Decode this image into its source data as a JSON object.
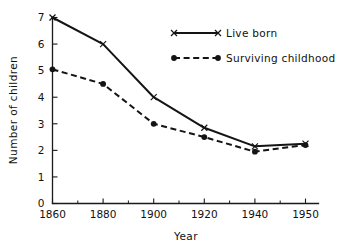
{
  "chart_data": {
    "type": "line",
    "title": "",
    "xlabel": "Year",
    "ylabel": "Number of children",
    "categories": [
      "1860",
      "1880",
      "1900",
      "1920",
      "1940",
      "1950"
    ],
    "x_tick_labels": [
      "1860",
      "1880",
      "1900",
      "1920",
      "1940",
      "1950"
    ],
    "y_tick_labels": [
      "0",
      "1",
      "2",
      "3",
      "4",
      "5",
      "6",
      "7"
    ],
    "ylim": [
      0,
      7
    ],
    "xlim_note": "categorical even spacing; 1940 to 1950 spaced same as 20-year intervals",
    "grid": false,
    "legend_position": "upper right",
    "minor_ticks_x": true,
    "minor_ticks_y": false,
    "axis_style": "left and bottom spines only, ticks pointing inward",
    "series": [
      {
        "name": "Live born",
        "marker": "x",
        "linestyle": "solid",
        "color": "#141414",
        "values": [
          7.0,
          6.0,
          4.0,
          2.85,
          2.15,
          2.25
        ]
      },
      {
        "name": "Surviving childhood",
        "marker": "filled-circle",
        "linestyle": "dashed",
        "color": "#141414",
        "values": [
          5.05,
          4.5,
          3.0,
          2.5,
          1.95,
          2.2
        ]
      }
    ]
  },
  "legend": {
    "entries": [
      {
        "label": "Live born",
        "marker": "x",
        "linestyle": "solid"
      },
      {
        "label": "Surviving childhood",
        "marker": "filled-circle",
        "linestyle": "dashed"
      }
    ]
  }
}
